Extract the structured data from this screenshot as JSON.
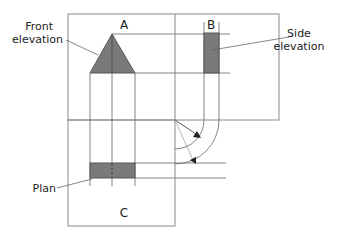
{
  "diagram": {
    "views": {
      "front": {
        "letter": "A",
        "label_line1": "Front",
        "label_line2": "elevation"
      },
      "side": {
        "letter": "B",
        "label_line1": "Side",
        "label_line2": "elevation"
      },
      "plan": {
        "letter": "C",
        "label": "Plan"
      }
    },
    "colors": {
      "fill": "#7a7a7a",
      "stroke": "#555555",
      "line": "#888888"
    }
  }
}
